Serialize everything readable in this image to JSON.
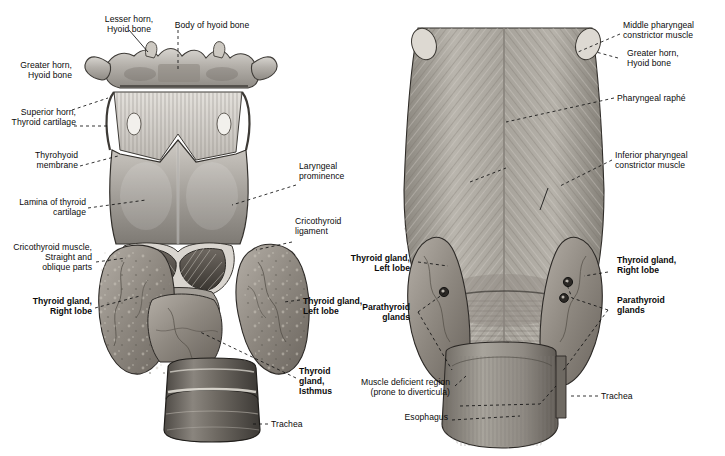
{
  "figure": {
    "kind": "anatomical-illustration",
    "background_color": "#ffffff",
    "ink_color": "#0b0b0b",
    "panels": [
      {
        "id": "anterior",
        "position": "left",
        "view": "anterior view of larynx and thyroid gland"
      },
      {
        "id": "posterior",
        "position": "right",
        "view": "posterior view of pharynx and thyroid gland"
      }
    ]
  },
  "left_panel": {
    "labels": [
      {
        "id": "lesser-horn-hyoid",
        "text": "Lesser horn,\nHyoid bone",
        "bold": false,
        "align": "center"
      },
      {
        "id": "body-of-hyoid",
        "text": "Body of hyoid bone",
        "bold": false,
        "align": "center"
      },
      {
        "id": "greater-horn-hyoid",
        "text": "Greater horn,\nHyoid bone",
        "bold": false,
        "align": "right"
      },
      {
        "id": "superior-horn-thyroid",
        "text": "Superior horn,\nThyroid cartilage",
        "bold": false,
        "align": "right"
      },
      {
        "id": "thyrohyoid-membrane",
        "text": "Thyrohyoid\nmembrane",
        "bold": false,
        "align": "right"
      },
      {
        "id": "lamina-thyroid",
        "text": "Lamina of thyroid\ncartilage",
        "bold": false,
        "align": "right"
      },
      {
        "id": "cricothyroid-muscle",
        "text": "Cricothyroid muscle,\nStraight and\noblique parts",
        "bold": false,
        "align": "right"
      },
      {
        "id": "thyroid-right-lobe",
        "text": "Thyroid gland,\nRight lobe",
        "bold": true,
        "align": "right"
      },
      {
        "id": "laryngeal-prominence",
        "text": "Laryngeal\nprominence",
        "bold": false,
        "align": "left"
      },
      {
        "id": "cricothyroid-ligament",
        "text": "Cricothyroid\nligament",
        "bold": false,
        "align": "left"
      },
      {
        "id": "thyroid-left-lobe",
        "text": "Thyroid gland,\nLeft lobe",
        "bold": true,
        "align": "left"
      },
      {
        "id": "thyroid-isthmus",
        "text": "Thyroid\ngland,\nIsthmus",
        "bold": true,
        "align": "left"
      },
      {
        "id": "trachea",
        "text": "Trachea",
        "bold": false,
        "align": "left"
      }
    ]
  },
  "right_panel": {
    "labels": [
      {
        "id": "middle-pharyngeal-constrictor",
        "text": "Middle pharyngeal\nconstrictor muscle",
        "bold": false,
        "align": "left"
      },
      {
        "id": "greater-horn-hyoid-post",
        "text": "Greater horn,\nHyoid bone",
        "bold": false,
        "align": "left"
      },
      {
        "id": "pharyngeal-raphe",
        "text": "Pharyngeal raphé",
        "bold": false,
        "align": "left"
      },
      {
        "id": "inferior-pharyngeal-constrictor",
        "text": "Inferior pharyngeal\nconstrictor muscle",
        "bold": false,
        "align": "left"
      },
      {
        "id": "thyroid-left-lobe-post",
        "text": "Thyroid gland,\nLeft lobe",
        "bold": true,
        "align": "right"
      },
      {
        "id": "parathyroid-glands-left",
        "text": "Parathyroid\nglands",
        "bold": true,
        "align": "right"
      },
      {
        "id": "muscle-deficient-region",
        "text": "Muscle deficient region\n(prone to diverticula)",
        "bold": false,
        "align": "right"
      },
      {
        "id": "esophagus",
        "text": "Esophagus",
        "bold": false,
        "align": "right"
      },
      {
        "id": "thyroid-right-lobe-post",
        "text": "Thyroid gland,\nRight lobe",
        "bold": true,
        "align": "left"
      },
      {
        "id": "parathyroid-glands-right",
        "text": "Parathyroid\nglands",
        "bold": true,
        "align": "left"
      },
      {
        "id": "trachea-post",
        "text": "Trachea",
        "bold": false,
        "align": "left"
      }
    ]
  }
}
